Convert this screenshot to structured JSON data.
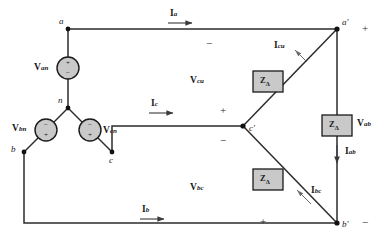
{
  "diagram": {
    "colors": {
      "wire": "#2b2b2b",
      "node": "#111111",
      "impedance_fill": "#c9c9c9",
      "impedance_stroke": "#1a1a1a",
      "source_fill": "#c9c9c9",
      "source_stroke": "#1a1a1a",
      "background": "#ffffff",
      "text": "#1a1a1a"
    },
    "nodes": [
      {
        "id": "a",
        "label": "a",
        "x": 68,
        "y": 29
      },
      {
        "id": "n",
        "label": "n",
        "x": 68,
        "y": 108
      },
      {
        "id": "b",
        "label": "b",
        "x": 24,
        "y": 152
      },
      {
        "id": "c",
        "label": "c",
        "x": 112,
        "y": 152
      },
      {
        "id": "ap",
        "label": "a'",
        "x": 337,
        "y": 29
      },
      {
        "id": "bp",
        "label": "b'",
        "x": 337,
        "y": 223
      },
      {
        "id": "cp",
        "label": "c'",
        "x": 243,
        "y": 126
      }
    ],
    "sources": [
      {
        "id": "van",
        "label": "V",
        "sub": "an",
        "top_sign": "+",
        "bottom_sign": "−"
      },
      {
        "id": "vbn",
        "label": "V",
        "sub": "bn",
        "top_sign": "−",
        "bottom_sign": "+"
      },
      {
        "id": "vcn",
        "label": "V",
        "sub": "cn",
        "top_sign": "−",
        "bottom_sign": "+"
      }
    ],
    "impedances": [
      {
        "id": "z-cu",
        "label": "Z",
        "sub": "Δ",
        "x": 268,
        "y": 82
      },
      {
        "id": "z-ab",
        "label": "Z",
        "sub": "Δ",
        "x": 337,
        "y": 126
      },
      {
        "id": "z-bc",
        "label": "Z",
        "sub": "Δ",
        "x": 268,
        "y": 180
      }
    ],
    "line_currents": [
      {
        "id": "ia",
        "label": "I",
        "sub": "a",
        "x": 173,
        "y": 14
      },
      {
        "id": "ic",
        "label": "I",
        "sub": "c",
        "x": 154,
        "y": 104
      },
      {
        "id": "ib",
        "label": "I",
        "sub": "b",
        "x": 145,
        "y": 210
      }
    ],
    "phase_currents": [
      {
        "id": "icu",
        "label": "I",
        "sub": "cu",
        "x": 280,
        "y": 46
      },
      {
        "id": "iab",
        "label": "I",
        "sub": "ab",
        "x": 355,
        "y": 152
      },
      {
        "id": "ibc",
        "label": "I",
        "sub": "bc",
        "x": 297,
        "y": 192
      }
    ],
    "phase_voltages": [
      {
        "id": "vcu",
        "label": "V",
        "sub": "cu",
        "x": 196,
        "y": 81
      },
      {
        "id": "vab",
        "label": "V",
        "sub": "ab",
        "x": 354,
        "y": 124
      },
      {
        "id": "vbc",
        "label": "V",
        "sub": "bc",
        "x": 196,
        "y": 188
      }
    ],
    "polarity_marks": [
      {
        "id": "pol-top-minus",
        "sign": "−",
        "x": 209,
        "y": 44
      },
      {
        "id": "pol-ap-plus",
        "sign": "+",
        "x": 365,
        "y": 29
      },
      {
        "id": "pol-cp-plus",
        "sign": "+",
        "x": 223,
        "y": 111
      },
      {
        "id": "pol-cp-minus",
        "sign": "−",
        "x": 223,
        "y": 141
      },
      {
        "id": "pol-bot-plus",
        "sign": "+",
        "x": 263,
        "y": 222
      },
      {
        "id": "pol-bp-minus",
        "sign": "−",
        "x": 365,
        "y": 223
      }
    ]
  }
}
